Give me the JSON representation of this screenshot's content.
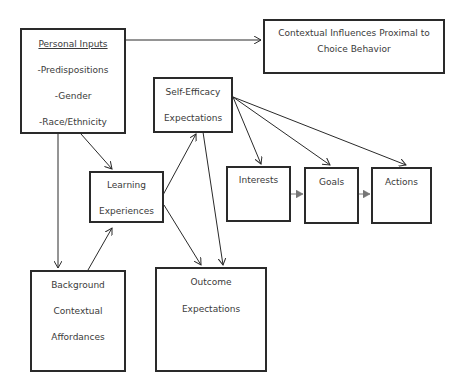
{
  "diagram": {
    "title": "",
    "nodes": {
      "personal_inputs": {
        "heading": "Personal Inputs",
        "lines": [
          "-Predispositions",
          "-Gender",
          "-Race/Ethnicity"
        ]
      },
      "contextual_influences": {
        "lines": [
          "Contextual Influences Proximal to",
          "Choice Behavior"
        ]
      },
      "self_efficacy": {
        "lines": [
          "Self-Efficacy",
          "Expectations"
        ]
      },
      "learning_experiences": {
        "lines": [
          "Learning",
          "Experiences"
        ]
      },
      "interests": {
        "label": "Interests"
      },
      "goals": {
        "label": "Goals"
      },
      "actions": {
        "label": "Actions"
      },
      "background_contextual": {
        "lines": [
          "Background",
          "Contextual",
          "Affordances"
        ]
      },
      "outcome_expectations": {
        "lines": [
          "Outcome",
          "Expectations"
        ]
      }
    },
    "edges": [
      {
        "from": "Personal Inputs",
        "to": "Contextual Influences Proximal to Choice Behavior"
      },
      {
        "from": "Personal Inputs",
        "to": "Learning Experiences"
      },
      {
        "from": "Personal Inputs",
        "to": "Background Contextual Affordances"
      },
      {
        "from": "Background Contextual Affordances",
        "to": "Learning Experiences"
      },
      {
        "from": "Learning Experiences",
        "to": "Self-Efficacy Expectations"
      },
      {
        "from": "Learning Experiences",
        "to": "Outcome Expectations"
      },
      {
        "from": "Self-Efficacy Expectations",
        "to": "Outcome Expectations"
      },
      {
        "from": "Self-Efficacy Expectations",
        "to": "Interests"
      },
      {
        "from": "Self-Efficacy Expectations",
        "to": "Goals"
      },
      {
        "from": "Self-Efficacy Expectations",
        "to": "Actions"
      },
      {
        "from": "Interests",
        "to": "Goals"
      },
      {
        "from": "Goals",
        "to": "Actions"
      }
    ]
  }
}
